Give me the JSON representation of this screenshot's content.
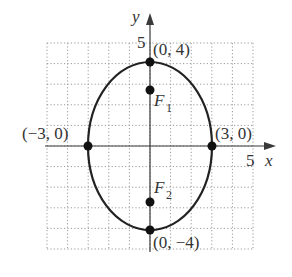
{
  "diagram": {
    "type": "ellipse-graph",
    "equation_parameters": {
      "a": 3,
      "b": 4,
      "center": [
        0,
        0
      ],
      "major_axis": "vertical"
    },
    "axes": {
      "x_label": "x",
      "y_label": "y",
      "x_tick_label": "5",
      "y_tick_label": "5",
      "range": {
        "xmin": -5,
        "xmax": 5,
        "ymin": -5,
        "ymax": 5
      },
      "grid": true
    },
    "points": [
      {
        "id": "top-vertex",
        "label": "(0, 4)",
        "x": 0,
        "y": 4
      },
      {
        "id": "bottom-vertex",
        "label": "(0, −4)",
        "x": 0,
        "y": -4
      },
      {
        "id": "left-vertex",
        "label": "(−3, 0)",
        "x": -3,
        "y": 0
      },
      {
        "id": "right-vertex",
        "label": "(3, 0)",
        "x": 3,
        "y": 0
      }
    ],
    "foci": [
      {
        "id": "focus-1",
        "label": "F",
        "subscript": "1",
        "x": 0,
        "y": 2.65
      },
      {
        "id": "focus-2",
        "label": "F",
        "subscript": "2",
        "x": 0,
        "y": -2.65
      }
    ],
    "colors": {
      "curve": "#222222",
      "axis": "#3a3a3a",
      "grid": "#9a9a9a",
      "point": "#111111"
    }
  }
}
